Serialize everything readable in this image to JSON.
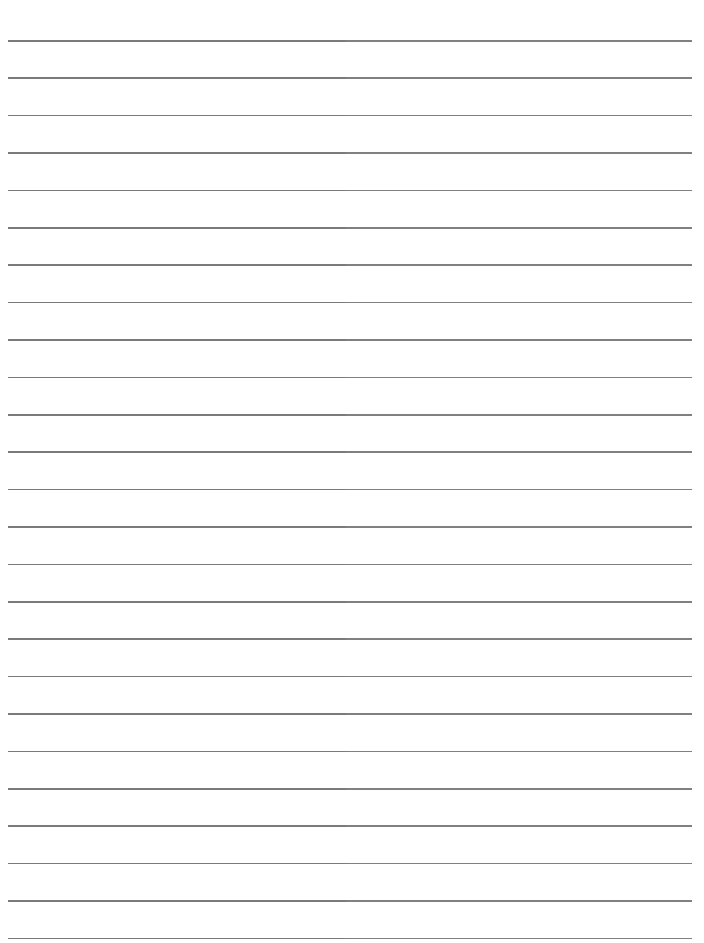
{
  "page": {
    "type": "lined-paper",
    "background_color": "#ffffff",
    "line_color": "#7a7a7a",
    "line_count": 25,
    "first_line_y": 40,
    "line_spacing": 37.4,
    "line_left": 8,
    "line_right": 692,
    "text_content": []
  }
}
